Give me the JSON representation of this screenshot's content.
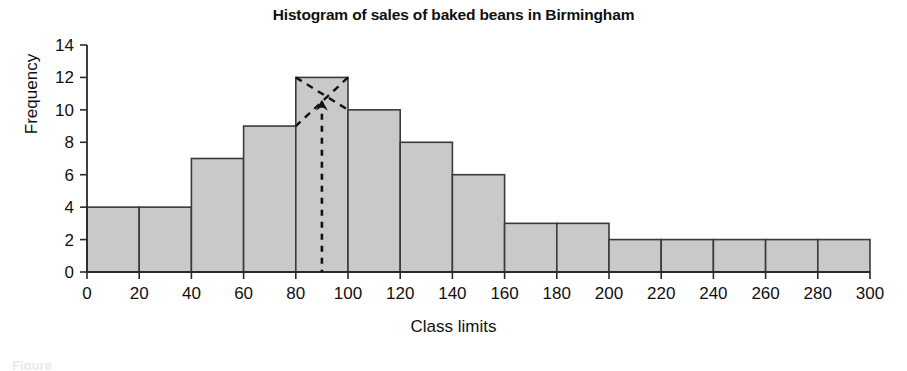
{
  "chart_data": {
    "type": "bar",
    "title": "Histogram of sales of baked beans in Birmingham",
    "xlabel": "Class limits",
    "ylabel": "Frequency",
    "xlim": [
      0,
      300
    ],
    "ylim": [
      0,
      14
    ],
    "xticks": [
      0,
      20,
      40,
      60,
      80,
      100,
      120,
      140,
      160,
      180,
      200,
      220,
      240,
      260,
      280,
      300
    ],
    "yticks": [
      0,
      2,
      4,
      6,
      8,
      10,
      12,
      14
    ],
    "grid": false,
    "legend": null,
    "bin_width": 20,
    "bin_edges": [
      0,
      20,
      40,
      60,
      80,
      100,
      120,
      140,
      160,
      180,
      200,
      220,
      240,
      260,
      280,
      300
    ],
    "categories": [
      "0-20",
      "20-40",
      "40-60",
      "60-80",
      "80-100",
      "100-120",
      "120-140",
      "140-160",
      "160-180",
      "180-200",
      "200-220",
      "220-240",
      "240-260",
      "260-280",
      "280-300"
    ],
    "values": [
      4,
      4,
      7,
      9,
      12,
      10,
      8,
      6,
      3,
      3,
      2,
      2,
      2,
      2,
      2
    ],
    "bar_fill": "#c9c9c9",
    "bar_stroke": "#3a3a3a",
    "annotations": {
      "mode_construction": {
        "modal_bin": "80-100",
        "modal_frequency": 12,
        "mode_value": 90,
        "style": "dashed",
        "description": "Crossed dashed lines drawn from the corners of the modal bar to the adjacent bar tops, with a vertical dashed line dropped from their intersection to the horizontal axis."
      }
    }
  },
  "figure": {
    "caption_partial": "Figure"
  }
}
